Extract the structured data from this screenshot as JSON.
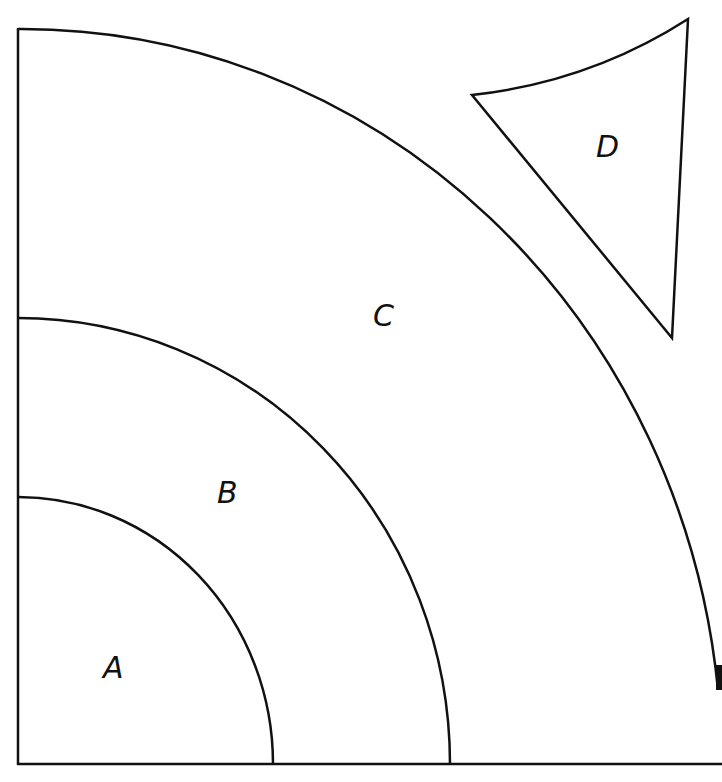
{
  "diagram": {
    "regions": [
      {
        "label": "A",
        "x": 114,
        "y": 668
      },
      {
        "label": "B",
        "x": 228,
        "y": 492
      },
      {
        "label": "C",
        "x": 385,
        "y": 314
      },
      {
        "label": "D",
        "x": 609,
        "y": 146
      }
    ],
    "stroke_color": "#111111",
    "background": "#ffffff"
  }
}
